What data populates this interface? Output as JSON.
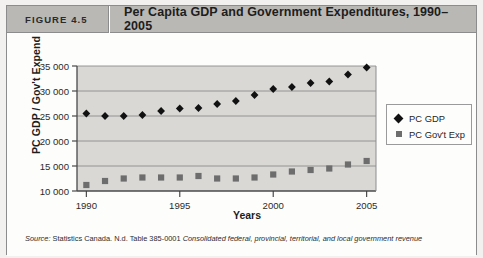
{
  "header": {
    "figure_label": "FIGURE 4.5",
    "title": "Per Capita GDP and Government Expenditures, 1990–2005"
  },
  "legend": {
    "items": [
      {
        "label": "PC GDP",
        "marker": "diamond-marker-icon",
        "color": "#111111"
      },
      {
        "label": "PC Gov't Exp",
        "marker": "square-marker-icon",
        "color": "#6d6d6d"
      }
    ]
  },
  "source": {
    "lead": "Source:",
    "line1_plain": " Statistics Canada. N.d. Table 385-0001 ",
    "line1_italic": "Consolidated federal, provincial, territorial, and local government revenue"
  },
  "chart_data": {
    "type": "scatter",
    "title": "Per Capita GDP and Government Expenditures, 1990–2005",
    "xlabel": "Years",
    "ylabel": "PC GDP / Gov't Expend",
    "x": [
      1990,
      1991,
      1992,
      1993,
      1994,
      1995,
      1996,
      1997,
      1998,
      1999,
      2000,
      2001,
      2002,
      2003,
      2004,
      2005
    ],
    "xlim": [
      1989.5,
      2005.5
    ],
    "ylim": [
      10000,
      35000
    ],
    "xticks": [
      1990,
      1995,
      2000,
      2005
    ],
    "xtick_labels": [
      "1990",
      "1995",
      "2000",
      "2005"
    ],
    "yticks": [
      10000,
      15000,
      20000,
      25000,
      30000,
      35000
    ],
    "ytick_labels": [
      "10 000",
      "15 000",
      "20 000",
      "25 000",
      "30 000",
      "35 000"
    ],
    "grid": "horizontal",
    "plot_background": "#d9d8d5",
    "legend_position": "right-outside",
    "series": [
      {
        "name": "PC GDP",
        "marker": "diamond",
        "color": "#111111",
        "values": [
          25500,
          25000,
          25000,
          25200,
          26000,
          26500,
          26600,
          27400,
          28000,
          29200,
          30400,
          30800,
          31600,
          31900,
          33300,
          34700
        ]
      },
      {
        "name": "PC Gov't Exp",
        "marker": "square",
        "color": "#6d6d6d",
        "values": [
          11200,
          12000,
          12500,
          12700,
          12700,
          12700,
          13000,
          12500,
          12500,
          12700,
          13300,
          13900,
          14200,
          14500,
          15300,
          16000
        ]
      }
    ]
  }
}
